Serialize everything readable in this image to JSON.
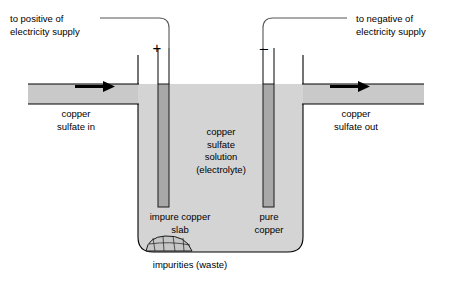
{
  "diagram": {
    "colors": {
      "solution_fill": "#d4d4d4",
      "pipe_fill": "#c9c9c9",
      "electrode_fill": "#a8a8a8",
      "outline": "#000000",
      "wire": "#555555",
      "background": "#ffffff",
      "sediment_fill": "#c0c0c0"
    },
    "labels": {
      "positive_supply": "to positive of\nelectricity supply",
      "negative_supply": "to negative of\nelectricity supply",
      "inlet": "copper\nsulfate in",
      "outlet": "copper\nsulfate out",
      "electrolyte": "copper\nsulfate\nsolution\n(electrolyte)",
      "anode": "impure copper\nslab",
      "cathode": "pure\ncopper",
      "sediment": "impurities (waste)"
    },
    "terminals": {
      "positive_sign": "+",
      "negative_sign": "–"
    },
    "flow": {
      "inlet_arrow": "right-arrow-icon",
      "outlet_arrow": "right-arrow-icon"
    },
    "icons": {
      "anode_electrode": "anode-bar-icon",
      "cathode_electrode": "cathode-bar-icon",
      "sediment_mound": "sediment-mound-icon",
      "positive_wire": "positive-lead-wire-icon",
      "negative_wire": "negative-lead-wire-icon"
    }
  }
}
